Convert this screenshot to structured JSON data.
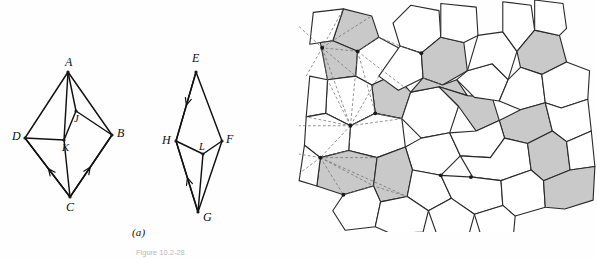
{
  "figure": {
    "caption": "Figure 10.2-28",
    "panels": [
      {
        "id": "a",
        "label": "(a)",
        "kind": "graph-diagram"
      },
      {
        "id": "b",
        "label": "(b)",
        "kind": "voronoi-tessellation"
      }
    ]
  },
  "panel_a": {
    "left_graph": {
      "name": "octahedron-graph-left",
      "vertices": [
        {
          "id": "A",
          "label": "A",
          "x": 68,
          "y": 72,
          "lx": 65,
          "ly": 66
        },
        {
          "id": "D",
          "label": "D",
          "x": 25,
          "y": 138,
          "lx": 12,
          "ly": 140
        },
        {
          "id": "B",
          "label": "B",
          "x": 112,
          "y": 135,
          "lx": 117,
          "ly": 137
        },
        {
          "id": "C",
          "label": "C",
          "x": 70,
          "y": 197,
          "lx": 66,
          "ly": 211
        },
        {
          "id": "J",
          "label": "J",
          "x": 76,
          "y": 111,
          "lx": 74,
          "ly": 122
        },
        {
          "id": "K",
          "label": "K",
          "x": 64,
          "y": 140,
          "lx": 62,
          "ly": 151
        }
      ],
      "edges": [
        [
          "A",
          "D"
        ],
        [
          "A",
          "B"
        ],
        [
          "A",
          "J"
        ],
        [
          "A",
          "K"
        ],
        [
          "D",
          "K"
        ],
        [
          "D",
          "C"
        ],
        [
          "J",
          "B"
        ],
        [
          "J",
          "K"
        ],
        [
          "K",
          "C"
        ],
        [
          "B",
          "C"
        ]
      ],
      "arrow_edges": [
        {
          "from": "C",
          "to": "D",
          "note": "arrow pointing up-left toward D"
        },
        {
          "from": "C",
          "to": "B",
          "note": "arrow pointing up-right toward B"
        }
      ]
    },
    "right_graph": {
      "name": "octahedron-graph-right",
      "vertices": [
        {
          "id": "E",
          "label": "E",
          "x": 196,
          "y": 72,
          "lx": 192,
          "ly": 62
        },
        {
          "id": "H",
          "label": "H",
          "x": 176,
          "y": 141,
          "lx": 162,
          "ly": 144
        },
        {
          "id": "F",
          "label": "F",
          "x": 222,
          "y": 141,
          "lx": 226,
          "ly": 143
        },
        {
          "id": "G",
          "label": "G",
          "x": 198,
          "y": 212,
          "lx": 203,
          "ly": 221
        },
        {
          "id": "L",
          "label": "L",
          "x": 203,
          "y": 154,
          "lx": 199,
          "ly": 150
        }
      ],
      "edges": [
        [
          "E",
          "H"
        ],
        [
          "E",
          "F"
        ],
        [
          "H",
          "L"
        ],
        [
          "L",
          "F"
        ],
        [
          "H",
          "G"
        ],
        [
          "G",
          "L"
        ],
        [
          "G",
          "F"
        ]
      ],
      "arrow_edges": [
        {
          "from": "E",
          "to": "H",
          "note": "arrow pointing down toward H"
        },
        {
          "from": "G",
          "to": "H",
          "note": "arrow pointing up toward H"
        }
      ]
    }
  },
  "panel_b": {
    "name": "voronoi-tessellation",
    "description": "Irregular polygonal tessellation (Voronoi-like cells) with some cells shaded gray and dashed Delaunay-style construction lines radiating from several vertices on the left side",
    "colors": {
      "cell_fill_white": "#ffffff",
      "cell_fill_shaded": "#c9c9c9",
      "cell_stroke": "#2a2a2a",
      "dashed_line": "#707070"
    },
    "cells": [
      {
        "shaded": true,
        "pts": "20,-14 52,-6 60,18 36,34 8,22"
      },
      {
        "shaded": false,
        "pts": "-14,-10 20,-14 8,22 -18,26"
      },
      {
        "shaded": true,
        "pts": "-6,24 8,22 36,34 34,62 2,66"
      },
      {
        "shaded": false,
        "pts": "36,34 60,18 82,30 78,60 52,72 34,62"
      },
      {
        "shaded": true,
        "pts": "52,72 78,60 96,80 86,110 56,104"
      },
      {
        "shaded": false,
        "pts": "96,-18 128,-12 130,18 108,36 84,28 76,2"
      },
      {
        "shaded": false,
        "pts": "84,28 108,36 110,64 82,78 60,62"
      },
      {
        "shaded": true,
        "pts": "108,36 130,18 156,24 160,56 132,72 110,64"
      },
      {
        "shaded": false,
        "pts": "130,-20 170,-16 172,16 156,24 130,18"
      },
      {
        "shaded": false,
        "pts": "2,66 34,62 52,72 56,104 28,118 0,104"
      },
      {
        "shaded": false,
        "pts": "-18,62 2,66 0,104 -22,108"
      },
      {
        "shaded": false,
        "pts": "28,118 56,104 86,110 90,142 58,154 26,146"
      },
      {
        "shaded": false,
        "pts": "-22,108 0,104 28,118 26,146 -6,154 -24,140"
      },
      {
        "shaded": false,
        "pts": "86,110 96,80 128,74 150,96 140,126 108,132"
      },
      {
        "shaded": true,
        "pts": "96,80 110,64 132,72 148,66 160,84 128,74"
      },
      {
        "shaded": true,
        "pts": "128,74 160,84 188,86 196,112 170,124 150,96"
      },
      {
        "shaded": false,
        "pts": "160,56 188,48 206,66 196,90 168,86 148,66"
      },
      {
        "shaded": false,
        "pts": "172,16 200,12 216,34 206,66 188,48 160,56"
      },
      {
        "shaded": false,
        "pts": "200,-22 232,-18 236,10 216,34 200,12"
      },
      {
        "shaded": true,
        "pts": "216,34 236,10 264,16 272,46 244,60 220,52"
      },
      {
        "shaded": false,
        "pts": "236,-24 268,-20 272,8 264,16 236,10"
      },
      {
        "shaded": false,
        "pts": "206,66 220,52 244,60 248,92 220,100 196,90"
      },
      {
        "shaded": false,
        "pts": "244,60 272,46 298,56 296,88 266,98 248,92"
      },
      {
        "shaded": true,
        "pts": "196,112 220,100 248,92 256,124 228,138 202,132"
      },
      {
        "shaded": false,
        "pts": "248,92 266,98 296,88 300,124 272,136 256,124"
      },
      {
        "shaded": false,
        "pts": "90,142 108,132 140,126 152,152 130,174 98,168"
      },
      {
        "shaded": false,
        "pts": "140,126 170,124 196,112 202,132 186,154 152,152"
      },
      {
        "shaded": false,
        "pts": "152,152 186,154 202,132 228,138 232,168 198,180 166,176"
      },
      {
        "shaded": true,
        "pts": "228,138 256,124 272,136 276,168 246,180 232,168"
      },
      {
        "shaded": false,
        "pts": "272,136 300,124 304,164 276,168"
      },
      {
        "shaded": true,
        "pts": "-6,154 26,146 58,154 54,186 20,196 -10,186"
      },
      {
        "shaded": true,
        "pts": "58,154 90,142 98,168 92,198 62,204 54,186"
      },
      {
        "shaded": false,
        "pts": "-24,140 -6,154 -10,186 -30,180"
      },
      {
        "shaded": false,
        "pts": "98,168 130,174 142,200 116,214 92,198"
      },
      {
        "shaded": false,
        "pts": "130,174 166,176 198,180 200,208 168,218 142,200"
      },
      {
        "shaded": false,
        "pts": "198,180 232,168 246,180 248,210 214,220 200,208"
      },
      {
        "shaded": true,
        "pts": "246,180 276,168 304,164 302,202 270,212 248,210"
      },
      {
        "shaded": false,
        "pts": "20,196 54,186 62,204 56,232 22,236 8,214"
      },
      {
        "shaded": false,
        "pts": "62,204 92,198 116,214 110,238 74,240 56,232"
      },
      {
        "shaded": false,
        "pts": "116,214 142,200 168,218 162,240 126,242"
      },
      {
        "shaded": false,
        "pts": "168,218 200,208 214,220 212,242 176,244"
      }
    ],
    "dashed_lines": [
      "-30,6 -4,30 36,34",
      "-4,30 20,-14",
      "-4,30 8,22 52,-6",
      "-4,30 2,66",
      "-4,30 34,62",
      "-4,30 -22,62",
      "36,34 60,18 84,28 108,36",
      "36,34 56,104",
      "28,118 -22,108",
      "28,118 -30,118",
      "28,118 -4,30",
      "28,118 2,66",
      "28,118 36,34",
      "28,118 56,104",
      "28,118 86,110",
      "28,118 60,62",
      "28,118 26,146",
      "28,118 -6,154",
      "-6,154 -30,150",
      "-6,154 -30,172",
      "-6,154 26,146",
      "-6,154 54,186",
      "-6,154 20,196",
      "-6,154 58,154",
      "-6,154 92,198",
      "20,196 54,186 92,198",
      "36,34 96,80",
      "110,64 132,72",
      "56,104 86,110"
    ]
  }
}
